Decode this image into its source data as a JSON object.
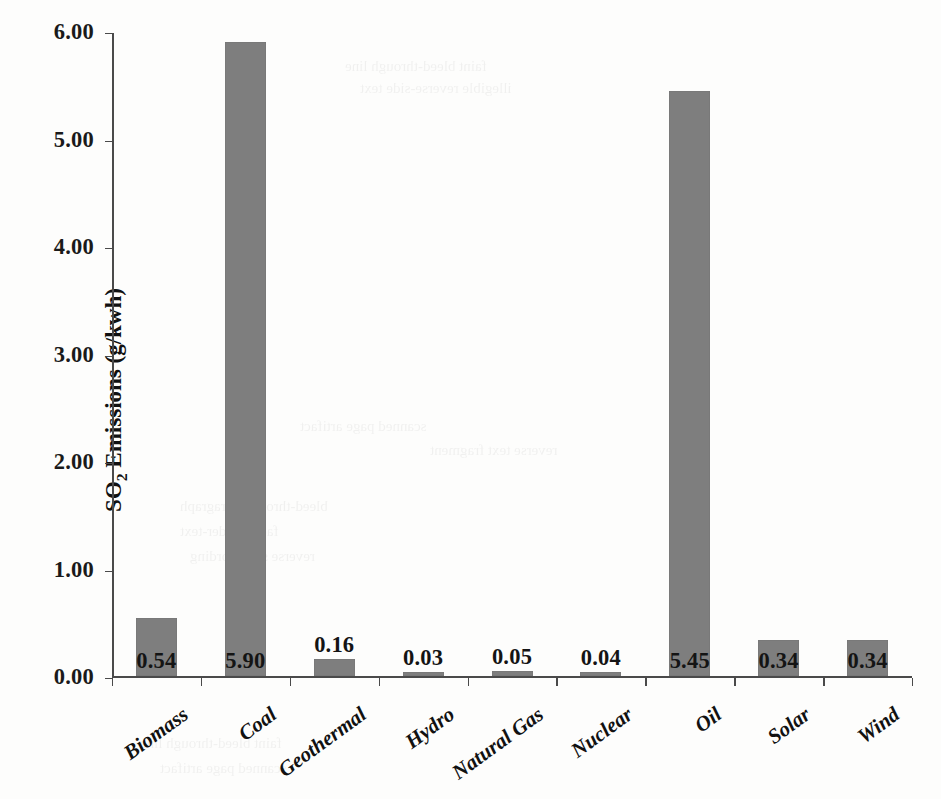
{
  "chart_data": {
    "type": "bar",
    "title": "",
    "xlabel": "",
    "ylabel_prefix": "SO",
    "ylabel_sub": "2",
    "ylabel_suffix": " Emissions (g/kwh)",
    "ylabel": "SO2 Emissions (g/kwh)",
    "categories": [
      "Biomass",
      "Coal",
      "Geothermal",
      "Hydro",
      "Natural Gas",
      "Nuclear",
      "Oil",
      "Solar",
      "Wind"
    ],
    "values": [
      0.54,
      5.9,
      0.16,
      0.03,
      0.05,
      0.04,
      5.45,
      0.34,
      0.34
    ],
    "value_labels": [
      "0.54",
      "5.90",
      "0.16",
      "0.03",
      "0.05",
      "0.04",
      "5.45",
      "0.34",
      "0.34"
    ],
    "ylim": [
      0,
      6
    ],
    "ytick_values": [
      0,
      1,
      2,
      3,
      4,
      5,
      6
    ],
    "ytick_labels": [
      "0.00",
      "1.00",
      "2.00",
      "3.00",
      "4.00",
      "5.00",
      "6.00"
    ],
    "grid": false,
    "legend": null,
    "bar_color": "#7e7e7e",
    "axis_color": "#4a4a4a",
    "background": "#fdfdfc"
  },
  "ghost_text": [
    "faint bleed-through line",
    "illegible reverse-side text",
    "scanned page artifact",
    "reverse text fragment",
    "bleed-through paragraph",
    "faded under-text",
    "reverse side wording"
  ]
}
